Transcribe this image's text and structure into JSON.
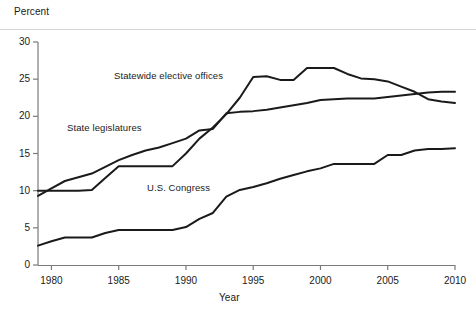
{
  "chart_data": {
    "type": "line",
    "title": "",
    "ylabel": "Percent",
    "xlabel": "Year",
    "xlim": [
      1979,
      2010
    ],
    "ylim": [
      0,
      30
    ],
    "yticks": [
      0,
      5,
      10,
      15,
      20,
      25,
      30
    ],
    "ytick_labels": [
      "0",
      "5",
      "10",
      "15",
      "20",
      "25",
      "30"
    ],
    "xticks": [
      1980,
      1985,
      1990,
      1995,
      2000,
      2005,
      2010
    ],
    "xtick_labels": [
      "1980",
      "1985",
      "1990",
      "1995",
      "2000",
      "2005",
      "2010"
    ],
    "grid": false,
    "legend_position": "inline-labels",
    "line_color": "#1a1a1a",
    "series": [
      {
        "name": "Statewide elective offices",
        "label": "Statewide elective offices",
        "x": [
          1979,
          1980,
          1981,
          1982,
          1983,
          1984,
          1985,
          1986,
          1987,
          1988,
          1989,
          1990,
          1991,
          1992,
          1993,
          1994,
          1995,
          1996,
          1997,
          1998,
          1999,
          2000,
          2001,
          2002,
          2003,
          2004,
          2005,
          2006,
          2007,
          2008,
          2009,
          2010
        ],
        "values": [
          10.0,
          10.0,
          10.0,
          10.0,
          10.1,
          11.7,
          13.3,
          13.3,
          13.3,
          13.3,
          13.3,
          15.0,
          17.0,
          18.5,
          20.3,
          22.5,
          25.3,
          25.4,
          24.9,
          24.9,
          26.5,
          26.5,
          26.5,
          25.7,
          25.1,
          25.0,
          24.7,
          24.0,
          23.3,
          22.3,
          22.0,
          21.8
        ]
      },
      {
        "name": "State legislatures",
        "label": "State legislatures",
        "x": [
          1979,
          1980,
          1981,
          1982,
          1983,
          1984,
          1985,
          1986,
          1987,
          1988,
          1989,
          1990,
          1991,
          1992,
          1993,
          1994,
          1995,
          1996,
          1997,
          1998,
          1999,
          2000,
          2001,
          2002,
          2003,
          2004,
          2005,
          2006,
          2007,
          2008,
          2009,
          2010
        ],
        "values": [
          9.3,
          10.3,
          11.3,
          11.8,
          12.3,
          13.2,
          14.1,
          14.8,
          15.4,
          15.8,
          16.4,
          17.0,
          18.1,
          18.3,
          20.4,
          20.6,
          20.7,
          20.9,
          21.2,
          21.5,
          21.8,
          22.2,
          22.3,
          22.4,
          22.4,
          22.4,
          22.6,
          22.8,
          23.0,
          23.2,
          23.3,
          23.3
        ]
      },
      {
        "name": "U.S. Congress",
        "label": "U.S. Congress",
        "x": [
          1979,
          1980,
          1981,
          1982,
          1983,
          1984,
          1985,
          1986,
          1987,
          1988,
          1989,
          1990,
          1991,
          1992,
          1993,
          1994,
          1995,
          1996,
          1997,
          1998,
          1999,
          2000,
          2001,
          2002,
          2003,
          2004,
          2005,
          2006,
          2007,
          2008,
          2009,
          2010
        ],
        "values": [
          2.6,
          3.2,
          3.7,
          3.7,
          3.7,
          4.3,
          4.7,
          4.7,
          4.7,
          4.7,
          4.7,
          5.1,
          6.2,
          7.0,
          9.2,
          10.1,
          10.5,
          11.0,
          11.6,
          12.1,
          12.6,
          13.0,
          13.6,
          13.6,
          13.6,
          13.6,
          14.8,
          14.8,
          15.4,
          15.6,
          15.6,
          15.7
        ]
      }
    ],
    "series_label_positions": [
      {
        "name": "Statewide elective offices",
        "x_px": 114,
        "y_px": 70
      },
      {
        "name": "State legislatures",
        "x_px": 67,
        "y_px": 122
      },
      {
        "name": "U.S. Congress",
        "x_px": 147,
        "y_px": 182
      }
    ]
  }
}
